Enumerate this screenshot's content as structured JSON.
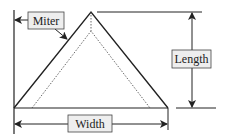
{
  "diagram": {
    "labels": {
      "miter": "Miter",
      "length": "Length",
      "width": "Width"
    },
    "colors": {
      "line": "#222222",
      "label_fill": "#eeeeee",
      "label_stroke": "#444444",
      "background": "#ffffff"
    }
  }
}
